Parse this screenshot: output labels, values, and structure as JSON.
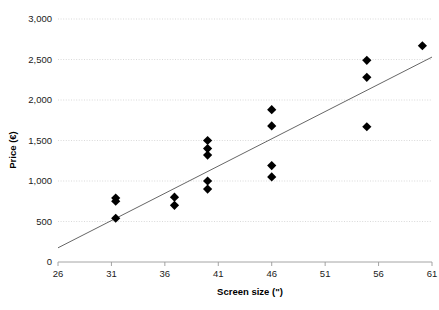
{
  "chart_data": {
    "type": "scatter",
    "title": "",
    "xlabel": "Screen size (\")",
    "ylabel": "Price (€)",
    "xlim": [
      26,
      61
    ],
    "ylim": [
      0,
      3000
    ],
    "xticks": [
      "26",
      "31",
      "36",
      "41",
      "46",
      "51",
      "56",
      "61"
    ],
    "xtick_values": [
      26,
      31,
      36,
      41,
      46,
      51,
      56,
      61
    ],
    "yticks": [
      "0",
      "500",
      "1,000",
      "1,500",
      "2,000",
      "2,500",
      "3,000"
    ],
    "ytick_values": [
      0,
      500,
      1000,
      1500,
      2000,
      2500,
      3000
    ],
    "grid": true,
    "legend": false,
    "marker": "diamond",
    "marker_color": "#000000",
    "trendline_color": "#555555",
    "gridline_color": "#c8c8c8",
    "points": [
      {
        "x": 31.4,
        "y": 790
      },
      {
        "x": 31.4,
        "y": 750
      },
      {
        "x": 31.4,
        "y": 540
      },
      {
        "x": 36.9,
        "y": 800
      },
      {
        "x": 36.9,
        "y": 700
      },
      {
        "x": 40.0,
        "y": 1500
      },
      {
        "x": 40.0,
        "y": 1400
      },
      {
        "x": 40.0,
        "y": 1320
      },
      {
        "x": 40.0,
        "y": 1000
      },
      {
        "x": 40.0,
        "y": 900
      },
      {
        "x": 46.0,
        "y": 1880
      },
      {
        "x": 46.0,
        "y": 1680
      },
      {
        "x": 46.0,
        "y": 1190
      },
      {
        "x": 46.0,
        "y": 1050
      },
      {
        "x": 54.9,
        "y": 2490
      },
      {
        "x": 54.9,
        "y": 2280
      },
      {
        "x": 54.9,
        "y": 1670
      },
      {
        "x": 60.1,
        "y": 2670
      }
    ],
    "trendline": {
      "x_start": 26.0,
      "y_start": 175,
      "x_end": 61.0,
      "y_end": 2530
    }
  }
}
